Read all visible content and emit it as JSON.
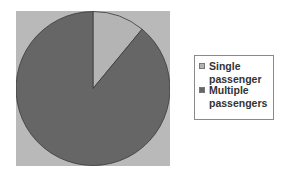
{
  "chart_data": {
    "type": "pie",
    "title": "",
    "categories": [
      "Single passenger",
      "Multiple passengers"
    ],
    "values": [
      11,
      89
    ],
    "colors": [
      "#b4b4b4",
      "#666666"
    ],
    "start_angle": "12 o'clock, clockwise",
    "legend": {
      "position": "right",
      "entries": [
        "Single passenger",
        "Multiple passengers"
      ]
    },
    "plot_background": "#b9b9b9"
  },
  "legend": {
    "items": [
      {
        "label": "Single passenger",
        "color": "#b4b4b4"
      },
      {
        "label": "Multiple passengers",
        "color": "#666666"
      }
    ]
  }
}
